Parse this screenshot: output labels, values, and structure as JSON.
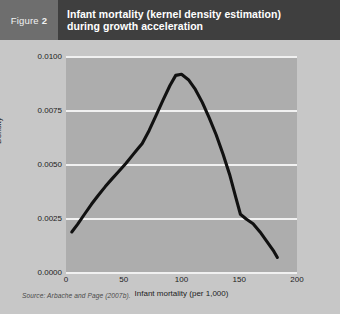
{
  "header": {
    "badge_word": "Figure",
    "badge_number": "2",
    "title_line1": "Infant mortality (kernel density estimation)",
    "title_line2": "during growth acceleration",
    "bar_color": "#3f3f3f",
    "badge_color": "#6e6e6e",
    "title_color": "#ffffff"
  },
  "figure": {
    "source_note": "Source: Arbache and Page (2007b).",
    "panel_color": "#adadad",
    "gridline_color": "#f1f1f1",
    "curve_color": "#111111",
    "background_color": "#c7c7c7"
  },
  "chart_data": {
    "type": "line",
    "title": "Infant mortality (kernel density estimation) during growth acceleration",
    "xlabel": "Infant mortality (per 1,000)",
    "ylabel": "Density",
    "xlim": [
      0,
      200
    ],
    "ylim": [
      0.0,
      0.01
    ],
    "xticks": [
      0,
      50,
      100,
      150,
      200
    ],
    "xtick_labels": [
      "0",
      "50",
      "100",
      "150",
      "200"
    ],
    "yticks": [
      0.0,
      0.0025,
      0.005,
      0.0075,
      0.01
    ],
    "ytick_labels": [
      "0.0000",
      "0.0025",
      "0.0050",
      "0.0075",
      "0.0100"
    ],
    "grid": "horizontal",
    "legend": "none",
    "series": [
      {
        "name": "Kernel density",
        "x": [
          5,
          10,
          16,
          22,
          28,
          34,
          40,
          46,
          52,
          58,
          62,
          66,
          72,
          78,
          84,
          90,
          95,
          100,
          106,
          112,
          118,
          124,
          130,
          136,
          142,
          147,
          151,
          156,
          162,
          168,
          174,
          180,
          183
        ],
        "y": [
          0.0019,
          0.00225,
          0.00272,
          0.00318,
          0.0036,
          0.004,
          0.00437,
          0.00472,
          0.00508,
          0.00548,
          0.00574,
          0.006,
          0.0066,
          0.0073,
          0.008,
          0.00868,
          0.00915,
          0.0092,
          0.00895,
          0.0085,
          0.0079,
          0.00718,
          0.0064,
          0.0055,
          0.0045,
          0.0035,
          0.00272,
          0.0025,
          0.00228,
          0.0019,
          0.00145,
          0.001,
          0.00072
        ]
      }
    ]
  }
}
